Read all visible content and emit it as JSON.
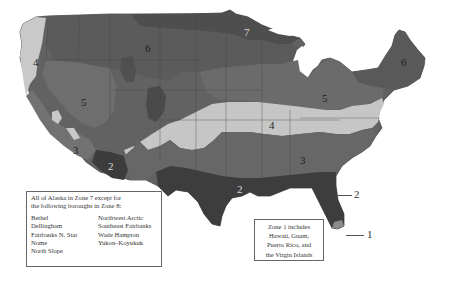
{
  "colors": {
    "zone_1": "#8a8a8a",
    "zone_2": "#3f3f3f",
    "zone_3": "#6b6b6b",
    "zone_4": "#c8c8c8",
    "zone_5": "#6e6e6e",
    "zone_6": "#5e5e5e",
    "zone_7": "#4e4e4e",
    "border": "#4a4a4a",
    "background": "#ffffff"
  },
  "zone_labels": [
    {
      "id": "zone-4-west",
      "text": "4",
      "x": 33,
      "y": 57
    },
    {
      "id": "zone-6-west",
      "text": "6",
      "x": 145,
      "y": 43
    },
    {
      "id": "zone-7-north",
      "text": "7",
      "x": 244,
      "y": 27
    },
    {
      "id": "zone-5-west",
      "text": "5",
      "x": 81,
      "y": 97
    },
    {
      "id": "zone-3-west",
      "text": "3",
      "x": 73,
      "y": 145
    },
    {
      "id": "zone-2-southwest",
      "text": "2",
      "x": 110,
      "y": 165
    },
    {
      "id": "zone-4-central",
      "text": "4",
      "x": 269,
      "y": 123
    },
    {
      "id": "zone-5-east",
      "text": "5",
      "x": 322,
      "y": 93
    },
    {
      "id": "zone-6-northeast",
      "text": "6",
      "x": 401,
      "y": 59
    },
    {
      "id": "zone-3-southeast",
      "text": "3",
      "x": 300,
      "y": 157
    },
    {
      "id": "zone-2-gulf",
      "text": "2",
      "x": 239,
      "y": 186
    }
  ],
  "callouts": [
    {
      "id": "callout-zone-2",
      "text": "2",
      "x": 356,
      "y": 190
    },
    {
      "id": "callout-zone-1",
      "text": "1",
      "x": 367,
      "y": 230
    }
  ],
  "alaska_note": {
    "heading_line1": "All of Alaska in Zone 7 except for",
    "heading_line2": "the following boroughs in Zone 8:",
    "boroughs_col1": [
      "Bethel",
      "Dellingham",
      "Fairbanks N. Star",
      "Nome",
      "North Slope"
    ],
    "boroughs_col2": [
      "Northwest Arctic",
      "Southeast Fairbanks",
      "Wade Hampton",
      "Yukon–Koyukuk"
    ]
  },
  "zone1_note": {
    "line1": "Zone 1 includes",
    "line2": "Hawaii, Guam,",
    "line3": "Puerto Rico, and",
    "line4": "the Virgin Islands"
  }
}
